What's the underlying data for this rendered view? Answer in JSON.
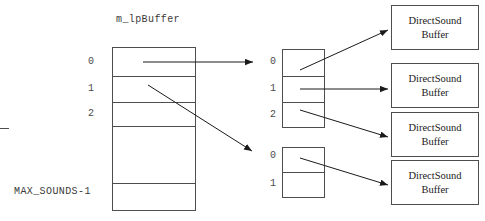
{
  "diagram": {
    "title": "m_lpBuffer",
    "max_label": "MAX_SOUNDS-1",
    "array_indices": [
      "0",
      "1",
      "2"
    ],
    "sub_array_1_indices": [
      "0",
      "1",
      "2"
    ],
    "sub_array_2_indices": [
      "0",
      "1"
    ],
    "buffers": [
      {
        "line1": "DirectSound",
        "line2": "Buffer"
      },
      {
        "line1": "DirectSound",
        "line2": "Buffer"
      },
      {
        "line1": "DirectSound",
        "line2": "Buffer"
      },
      {
        "line1": "DirectSound",
        "line2": "Buffer"
      }
    ],
    "colors": {
      "stroke": "#4d4d4d",
      "arrow": "#1a1a1a",
      "text": "#1a1a1a"
    }
  }
}
